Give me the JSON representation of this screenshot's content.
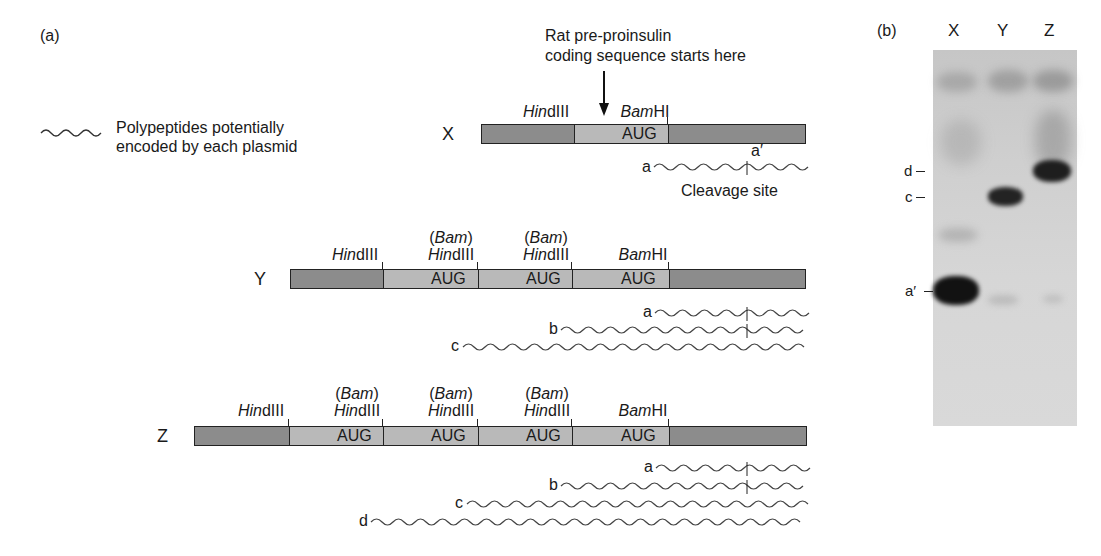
{
  "panel_a": {
    "label": "(a)",
    "legend": {
      "icon": "wavy-line-icon",
      "line1": "Polypeptides potentially",
      "line2": "encoded by each plasmid"
    },
    "annotation": {
      "line1": "Rat pre-proinsulin",
      "line2": "coding sequence starts here"
    },
    "cleavage_label": "Cleavage site",
    "codon": "AUG",
    "site_hind": "Hin",
    "site_hind_suffix": "dIII",
    "site_bam": "Bam",
    "site_bam_suffix": "HI",
    "site_bam_paren_open": "(",
    "site_bam_paren_close": ")",
    "plasmids": [
      {
        "name": "X",
        "inserts": 1,
        "polypeptides": [
          "a",
          "a′"
        ]
      },
      {
        "name": "Y",
        "inserts": 3,
        "polypeptides": [
          "a",
          "b",
          "c"
        ]
      },
      {
        "name": "Z",
        "inserts": 4,
        "polypeptides": [
          "a",
          "b",
          "c",
          "d"
        ]
      }
    ],
    "x": {
      "name": "X",
      "pep_a": "a",
      "pep_a_prime": "a′"
    },
    "y": {
      "name": "Y",
      "pep_a": "a",
      "pep_b": "b",
      "pep_c": "c"
    },
    "z": {
      "name": "Z",
      "pep_a": "a",
      "pep_b": "b",
      "pep_c": "c",
      "pep_d": "d"
    }
  },
  "panel_b": {
    "label": "(b)",
    "lanes": [
      "X",
      "Y",
      "Z"
    ],
    "lane_x": "X",
    "lane_y": "Y",
    "lane_z": "Z",
    "markers": {
      "d": "d",
      "c": "c",
      "a_prime": "a′"
    },
    "bands": [
      {
        "lane": "X",
        "marker": "a′",
        "intensity": "strong"
      },
      {
        "lane": "Y",
        "marker": "c",
        "intensity": "strong"
      },
      {
        "lane": "Z",
        "marker": "d",
        "intensity": "strong"
      }
    ]
  },
  "colors": {
    "vector": "#8c8c8c",
    "insert": "#b9b9b9",
    "band": "#1a1a1a",
    "gel": "#d0d0d0"
  }
}
